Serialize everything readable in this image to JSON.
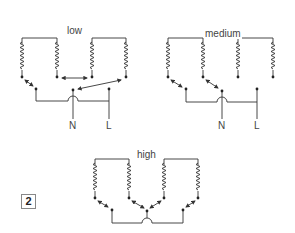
{
  "figure_number": "2",
  "diagrams": {
    "low": {
      "title": "low",
      "neutral_label": "N",
      "live_label": "L"
    },
    "medium": {
      "title": "medium",
      "neutral_label": "N",
      "live_label": "L"
    },
    "high": {
      "title": "high"
    }
  },
  "colors": {
    "line": "#333333",
    "text": "#444444",
    "background": "#ffffff"
  }
}
